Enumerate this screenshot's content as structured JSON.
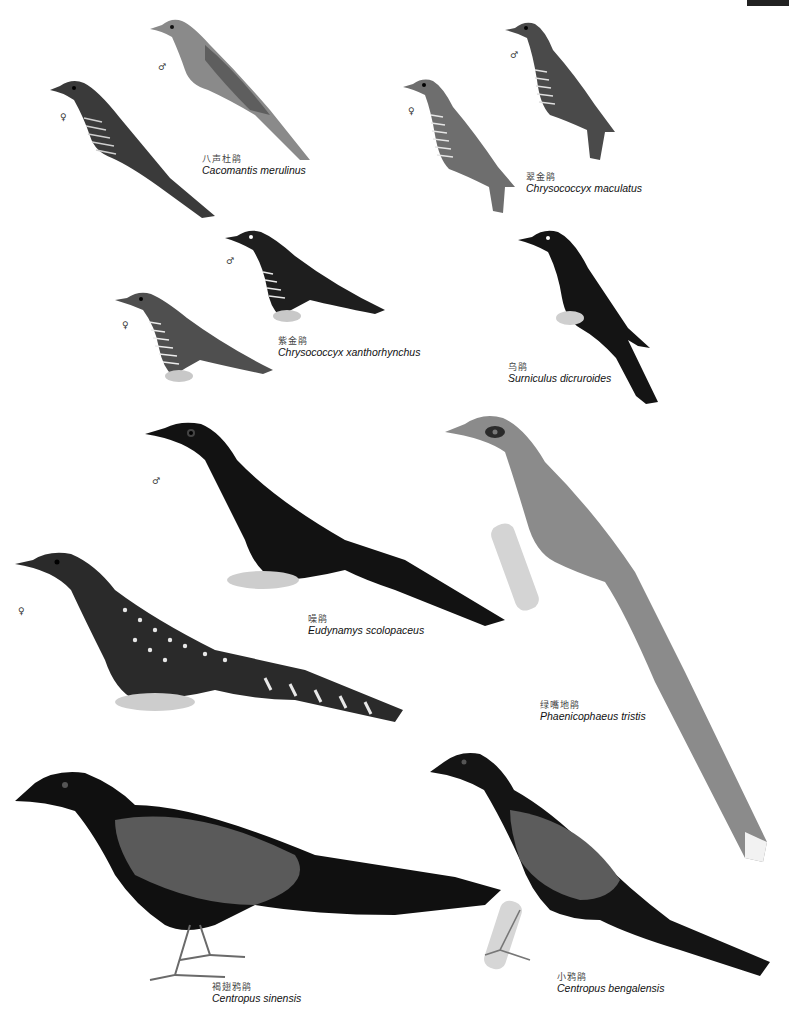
{
  "plate": {
    "corner_mark": "",
    "species": [
      {
        "id": "cacomantis",
        "cn": "八声杜鹃",
        "sci": "Cacomantis merulinus",
        "sexes": [
          "♂",
          "♀"
        ]
      },
      {
        "id": "maculatus",
        "cn": "翠金鹃",
        "sci": "Chrysococcyx maculatus",
        "sexes": [
          "♂",
          "♀"
        ]
      },
      {
        "id": "xanthorhynchus",
        "cn": "紫金鹃",
        "sci": "Chrysococcyx xanthorhynchus",
        "sexes": [
          "♂",
          "♀"
        ]
      },
      {
        "id": "surniculus",
        "cn": "乌鹃",
        "sci": "Surniculus dicruroides",
        "sexes": []
      },
      {
        "id": "eudynamys",
        "cn": "噪鹃",
        "sci": "Eudynamys scolopaceus",
        "sexes": [
          "♂",
          "♀"
        ]
      },
      {
        "id": "phaenicophaeus",
        "cn": "绿嘴地鹃",
        "sci": "Phaenicophaeus tristis",
        "sexes": []
      },
      {
        "id": "sinensis",
        "cn": "褐翅鸦鹃",
        "sci": "Centropus sinensis",
        "sexes": []
      },
      {
        "id": "bengalensis",
        "cn": "小鸦鹃",
        "sci": "Centropus bengalensis",
        "sexes": []
      }
    ]
  }
}
